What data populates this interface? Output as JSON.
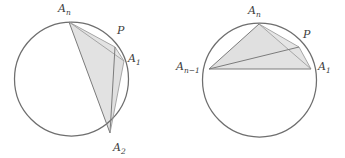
{
  "figure": {
    "background_color": "#ffffff",
    "stroke_color": "#6e6e6e",
    "shade_color": "#d9d9d9",
    "label_color": "#3d3d3d",
    "panels": [
      {
        "id": "left-panel",
        "circle": {
          "cx": 71.5,
          "cy": 79,
          "r": 57
        },
        "points": [
          {
            "key": "An",
            "label": "A",
            "sub": "n",
            "x": 69,
            "y": 22,
            "label_x": 58,
            "label_y": 12
          },
          {
            "key": "P",
            "label": "P",
            "sub": "",
            "x": 115,
            "y": 47,
            "label_x": 117,
            "label_y": 34
          },
          {
            "key": "A1",
            "label": "A",
            "sub": "1",
            "x": 124,
            "y": 61,
            "label_x": 128,
            "label_y": 62
          },
          {
            "key": "A2",
            "label": "A",
            "sub": "2",
            "x": 110,
            "y": 133,
            "label_x": 113,
            "label_y": 151
          }
        ],
        "shaded_main": "An,A1,A2",
        "shaded_sliver": "An,P,A1",
        "chords": [
          "An-A1",
          "An-A2",
          "A1-A2",
          "An-P",
          "P-A1",
          "P-A2"
        ]
      },
      {
        "id": "right-panel",
        "circle": {
          "cx": 259.5,
          "cy": 80,
          "r": 57
        },
        "points": [
          {
            "key": "An",
            "label": "A",
            "sub": "n",
            "x": 259,
            "y": 24,
            "label_x": 248,
            "label_y": 14
          },
          {
            "key": "P",
            "label": "P",
            "sub": "",
            "x": 299,
            "y": 47,
            "label_x": 303,
            "label_y": 38
          },
          {
            "key": "A1",
            "label": "A",
            "sub": "1",
            "x": 311,
            "y": 69,
            "label_x": 318,
            "label_y": 70
          },
          {
            "key": "An-1",
            "label": "A",
            "sub": "n−1",
            "x": 209,
            "y": 69,
            "label_x": 176,
            "label_y": 70
          }
        ],
        "shaded_main": "An-1,An,A1",
        "shaded_sliver": "An,P,A1",
        "chords": [
          "An-1-An",
          "An-A1",
          "An-1-A1",
          "An-P",
          "P-A1",
          "An-1-P"
        ]
      }
    ]
  }
}
